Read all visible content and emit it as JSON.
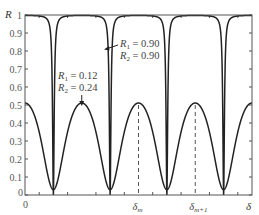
{
  "chart_data": {
    "type": "line",
    "title": "",
    "xlabel": "δ",
    "ylabel": "R",
    "ylim": [
      0,
      1
    ],
    "xlim_periods": [
      -0.5,
      3.5
    ],
    "x_tick_labels": [
      "0"
    ],
    "y_ticks": [
      0,
      0.1,
      0.2,
      0.3,
      0.4,
      0.5,
      0.6,
      0.7,
      0.8,
      0.9,
      1
    ],
    "y_tick_labels": [
      "0",
      "0.1",
      "0.2",
      "0.3",
      "0.4",
      "0.5",
      "0.6",
      "0.7",
      "0.8",
      "0.9",
      "1"
    ],
    "grid": false,
    "series": [
      {
        "name": "R1 = 0.90, R2 = 0.90",
        "R1": 0.9,
        "R2": 0.9,
        "max": 0.997,
        "min": 0.0,
        "label_lines": [
          {
            "sym": "R",
            "sub": "1",
            "val": " = 0.90"
          },
          {
            "sym": "R",
            "sub": "2",
            "val": " = 0.90"
          }
        ]
      },
      {
        "name": "R1 = 0.12, R2 = 0.24",
        "R1": 0.12,
        "R2": 0.24,
        "max": 0.511,
        "min": 0.03,
        "label_lines": [
          {
            "sym": "R",
            "sub": "1",
            "val": " = 0.12"
          },
          {
            "sym": "R",
            "sub": "2",
            "val": " = 0.24"
          }
        ]
      }
    ],
    "annotations": [
      {
        "text": "δ",
        "sub": "m",
        "at_period": 1.5,
        "dashed_line": true
      },
      {
        "text": "δ",
        "sub": "m+1",
        "at_period": 2.5,
        "dashed_line": true
      }
    ]
  }
}
